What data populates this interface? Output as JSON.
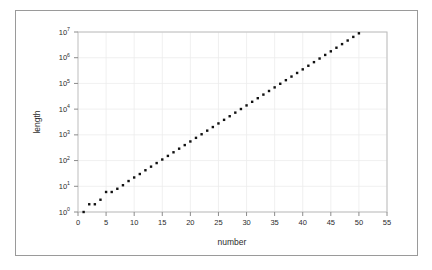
{
  "figure": {
    "background_color": "#ffffff",
    "frame_color": "#9a9a9a",
    "marker_color": "#111111",
    "grid_color": "#ececec",
    "axis_color": "#8c8c8c"
  },
  "chart_data": {
    "type": "scatter",
    "title": "",
    "xlabel": "number",
    "ylabel": "length",
    "xlim": [
      0,
      55
    ],
    "ylim": [
      1,
      10000000
    ],
    "yscale": "log",
    "xscale": "linear",
    "grid": true,
    "legend": null,
    "xticks": [
      0,
      5,
      10,
      15,
      20,
      25,
      30,
      35,
      40,
      45,
      50,
      55
    ],
    "xtick_labels": [
      "0",
      "5",
      "10",
      "15",
      "20",
      "25",
      "30",
      "35",
      "40",
      "45",
      "50",
      "55"
    ],
    "yticks": [
      1,
      10,
      100,
      1000,
      10000,
      100000,
      1000000,
      10000000
    ],
    "ytick_labels": [
      "10 0",
      "10 1",
      "10 2",
      "10 3",
      "10 4",
      "10 5",
      "10 6",
      "10 7"
    ],
    "ytick_mantissa": "10",
    "ytick_exponents": [
      "0",
      "1",
      "2",
      "3",
      "4",
      "5",
      "6",
      "7"
    ],
    "marker": "square",
    "marker_size": 2.4,
    "series": [
      {
        "name": "length",
        "x": [
          1,
          2,
          3,
          4,
          5,
          6,
          7,
          8,
          9,
          10,
          11,
          12,
          13,
          14,
          15,
          16,
          17,
          18,
          19,
          20,
          21,
          22,
          23,
          24,
          25,
          26,
          27,
          28,
          29,
          30,
          31,
          32,
          33,
          34,
          35,
          36,
          37,
          38,
          39,
          40,
          41,
          42,
          43,
          44,
          45,
          46,
          47,
          48,
          49,
          50,
          51,
          52,
          53,
          54
        ],
        "y": [
          1,
          2,
          2,
          3,
          6,
          6,
          8,
          11,
          16,
          22,
          30,
          42,
          58,
          80,
          110,
          152,
          210,
          290,
          400,
          553,
          764,
          1055,
          1457,
          2012,
          2779,
          3838,
          5300,
          7320,
          10110,
          13960,
          19280,
          26630,
          36780,
          50800,
          70150,
          96900,
          133800,
          184800,
          255200,
          352500,
          486800,
          672300,
          928500,
          1282000,
          1771000,
          2446000,
          3378000,
          4665000,
          6442000,
          8897000,
          12290000,
          16970000,
          23440000,
          32370000
        ]
      }
    ]
  }
}
